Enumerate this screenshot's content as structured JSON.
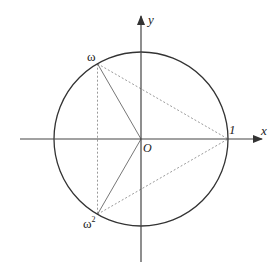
{
  "diagram": {
    "center": {
      "x": 141,
      "y": 139
    },
    "radius": 87,
    "axes": {
      "x_label": "x",
      "y_label": "y",
      "origin_label": "O"
    },
    "points": [
      {
        "id": "one",
        "label": "1",
        "angle_deg": 0
      },
      {
        "id": "omega",
        "label": "ω",
        "angle_deg": 120
      },
      {
        "id": "omega2",
        "label": "ω",
        "superscript": "2",
        "angle_deg": 240
      }
    ],
    "colors": {
      "circle": "#333333",
      "axes": "#444444",
      "radii": "#777777",
      "dashed": "#9a9a9a"
    }
  }
}
